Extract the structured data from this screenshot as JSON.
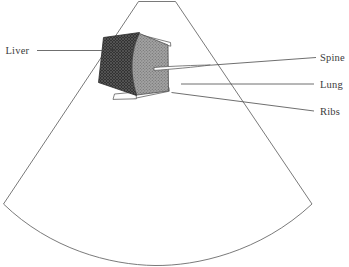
{
  "figure": {
    "kind": "ultrasound-sector-schematic",
    "background_color": "#ffffff",
    "outline_color": "#6b6b6b",
    "label_color": "#3c3c3c"
  },
  "labels": {
    "liver": "Liver",
    "spine": "Spine",
    "lung": "Lung",
    "ribs": "Ribs"
  },
  "regions": {
    "liver": {
      "name": "Liver",
      "fill_color": "#3a3a3a",
      "pattern": "fine-cross-hatch"
    },
    "lung": {
      "name": "Lung",
      "fill_color": "#9c9c9c",
      "pattern": "fine-stipple"
    },
    "ribs": {
      "name": "Ribs",
      "fill_color": "#fdfdfd",
      "pattern": "outline-sliver"
    },
    "spine": {
      "name": "Spine",
      "fill_color": "#fdfdfd",
      "pattern": "outline-lens"
    },
    "scan_sector": {
      "name": "Ultrasound scan sector",
      "fill_color": "#ffffff"
    }
  }
}
